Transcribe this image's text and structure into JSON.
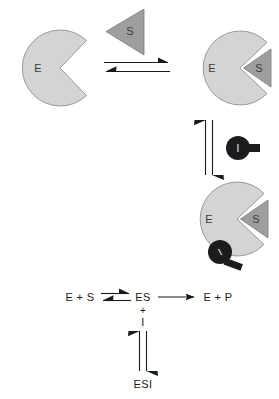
{
  "figure": {
    "background": "#ffffff"
  },
  "colors": {
    "enzyme_fill": "#d4d4d4",
    "enzyme_stroke": "#9a9a9a",
    "substrate_fill": "#9e9e9e",
    "substrate_stroke": "#7a7a7a",
    "inhibitor_fill": "#1c1c1c",
    "inhibitor_tail": "#1c1c1c",
    "arrow": "#1a1a1a",
    "arrow_light": "#6f6f6f",
    "text_dark": "#1a1a1a",
    "text_on_shape": "#3b3b3b",
    "text_on_dark": "#f2f2f2"
  },
  "panels": {
    "free_enzyme": {
      "name": "free-enzyme",
      "label": "E"
    },
    "free_substrate": {
      "name": "free-substrate",
      "label": "S"
    },
    "es_complex": {
      "name": "enzyme-substrate-complex",
      "enzyme_label": "E",
      "substrate_label": "S"
    },
    "free_inhibitor": {
      "name": "free-inhibitor",
      "label": "I"
    },
    "esi_complex": {
      "name": "enzyme-substrate-inhibitor-complex",
      "enzyme_label": "E",
      "substrate_label": "S",
      "inhibitor_label": "I"
    }
  },
  "arrows": {
    "binding_equilibrium": {
      "name": "horizontal-equilibrium-arrows",
      "direction": "bidirectional-horizontal"
    },
    "inhibitor_equilibrium": {
      "name": "vertical-equilibrium-arrows",
      "direction": "bidirectional-vertical"
    }
  },
  "equation": {
    "reactants": "E + S",
    "complex": "ES",
    "products": "E + P",
    "plus_sign": "+",
    "inhibitor": "I",
    "ternary_complex": "ESI",
    "forward_arrow_name": "es-to-products-arrow",
    "equilibrium_left_name": "substrate-binding-equilibrium",
    "equilibrium_down_name": "inhibitor-binding-equilibrium"
  }
}
